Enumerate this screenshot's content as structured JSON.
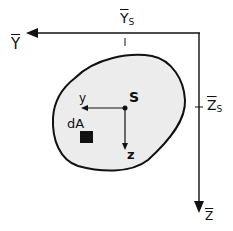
{
  "diagram": {
    "type": "cross-section coordinate systems",
    "labels": {
      "global_y": "Y",
      "global_z": "Z",
      "centroid_offset_y": "Y",
      "centroid_offset_y_sub": "S",
      "centroid_offset_z": "Z",
      "centroid_offset_z_sub": "S",
      "centroid": "S",
      "local_y": "y",
      "local_z": "z",
      "area_element": "dA"
    },
    "colors": {
      "section_fill": "#ececec",
      "line": "#111111"
    }
  }
}
